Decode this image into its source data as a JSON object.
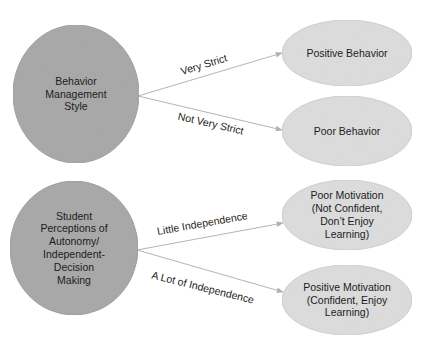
{
  "colors": {
    "source_fill": "#a9a9a9",
    "source_stroke": "#a0a0a0",
    "target_fill": "#dcdcdc",
    "target_stroke": "#cfcfcf",
    "edge": "#b5b5b5",
    "arrowhead": "#b0b0b0",
    "text": "#1c1c1c"
  },
  "groups": [
    {
      "source": {
        "id": "behavior-management-style",
        "shape": "circle",
        "cx": 76,
        "cy": 94,
        "rx": 63,
        "ry": 69,
        "lines": [
          "Behavior",
          "Management",
          "Style"
        ]
      },
      "edges": [
        {
          "label": "Very Strict",
          "from": [
            138,
            96
          ],
          "to": [
            282,
            53
          ],
          "label_x": 205,
          "label_y": 68,
          "label_angle": -17
        },
        {
          "label": "Not Very Strict",
          "from": [
            138,
            96
          ],
          "to": [
            282,
            130
          ],
          "label_x": 210,
          "label_y": 127,
          "label_angle": 13
        }
      ],
      "targets": [
        {
          "id": "positive-behavior",
          "shape": "ellipse",
          "cx": 347,
          "cy": 53,
          "rx": 65,
          "ry": 33,
          "lines": [
            "Positive Behavior"
          ]
        },
        {
          "id": "poor-behavior",
          "shape": "ellipse",
          "cx": 347,
          "cy": 131,
          "rx": 65,
          "ry": 35,
          "lines": [
            "Poor Behavior"
          ]
        }
      ]
    },
    {
      "source": {
        "id": "student-perceptions-of-autonomy",
        "shape": "circle",
        "cx": 74,
        "cy": 248,
        "rx": 64,
        "ry": 67,
        "lines": [
          "Student",
          "Perceptions of",
          "Autonomy/",
          "Independent-",
          "Decision",
          "Making"
        ]
      },
      "edges": [
        {
          "label": "Little Independence",
          "from": [
            137,
            250
          ],
          "to": [
            283,
            223
          ],
          "label_x": 203,
          "label_y": 227,
          "label_angle": -10
        },
        {
          "label": "A Lot of Independence",
          "from": [
            137,
            250
          ],
          "to": [
            283,
            292
          ],
          "label_x": 202,
          "label_y": 291,
          "label_angle": 14
        }
      ],
      "targets": [
        {
          "id": "poor-motivation",
          "shape": "ellipse",
          "cx": 347,
          "cy": 215,
          "rx": 65,
          "ry": 35,
          "lines": [
            "Poor Motivation",
            "(Not Confident,",
            "Don’t Enjoy",
            "Learning)"
          ]
        },
        {
          "id": "positive-motivation",
          "shape": "ellipse",
          "cx": 347,
          "cy": 300,
          "rx": 65,
          "ry": 35,
          "lines": [
            "Positive Motivation",
            "(Confident, Enjoy",
            "Learning)"
          ]
        }
      ]
    }
  ],
  "text_style": {
    "line_height": 12.8
  }
}
